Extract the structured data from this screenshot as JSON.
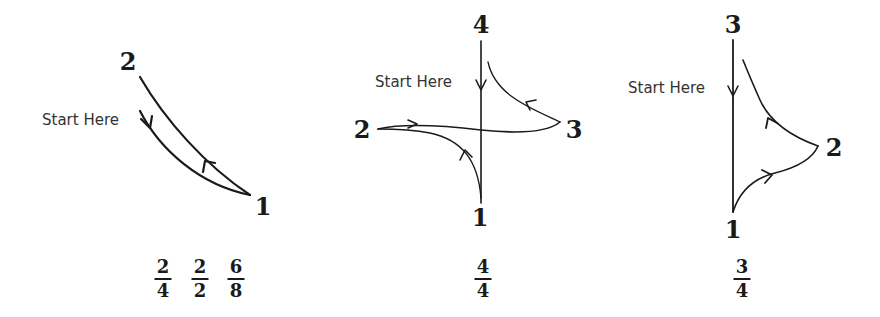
{
  "diagrams": [
    {
      "id": "left",
      "start_label": "Start Here",
      "points": [
        {
          "label": "2"
        },
        {
          "label": "1"
        }
      ],
      "time_signatures": [
        {
          "top": "2",
          "bottom": "4"
        },
        {
          "top": "2",
          "bottom": "2"
        },
        {
          "top": "6",
          "bottom": "8"
        }
      ]
    },
    {
      "id": "middle",
      "start_label": "Start Here",
      "points": [
        {
          "label": "4"
        },
        {
          "label": "2"
        },
        {
          "label": "3"
        },
        {
          "label": "1"
        }
      ],
      "time_signatures": [
        {
          "top": "4",
          "bottom": "4"
        }
      ]
    },
    {
      "id": "right",
      "start_label": "Start Here",
      "points": [
        {
          "label": "3"
        },
        {
          "label": "2"
        },
        {
          "label": "1"
        }
      ],
      "time_signatures": [
        {
          "top": "3",
          "bottom": "4"
        }
      ]
    }
  ],
  "colors": {
    "stroke": "#1a1a1a",
    "label_text": "#333333",
    "background": "#ffffff"
  }
}
